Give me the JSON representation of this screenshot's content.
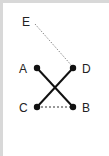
{
  "diagram": {
    "nodes": [
      {
        "id": "A",
        "label": "A",
        "x": 37,
        "y": 68
      },
      {
        "id": "B",
        "label": "B",
        "x": 73,
        "y": 107
      },
      {
        "id": "C",
        "label": "C",
        "x": 37,
        "y": 107
      },
      {
        "id": "D",
        "label": "D",
        "x": 73,
        "y": 68
      },
      {
        "id": "E",
        "label": "E",
        "x": 35,
        "y": 23
      }
    ],
    "edges": [
      {
        "from": "A",
        "to": "B",
        "style": "solid"
      },
      {
        "from": "D",
        "to": "C",
        "style": "solid"
      },
      {
        "from": "C",
        "to": "B",
        "style": "dashed"
      },
      {
        "from": "E",
        "to": "D",
        "style": "dotted"
      }
    ],
    "colors": {
      "line": "#111111",
      "dotted": "#888888",
      "border": "#d8d8d8"
    }
  }
}
